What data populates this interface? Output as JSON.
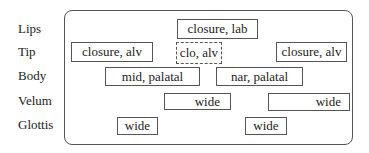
{
  "tiers": [
    {
      "label": "Lips"
    },
    {
      "label": "Tip"
    },
    {
      "label": "Body"
    },
    {
      "label": "Velum"
    },
    {
      "label": "Glottis"
    }
  ],
  "gestures": [
    {
      "tier": "Lips",
      "label": "closure, lab",
      "style": "solid"
    },
    {
      "tier": "Tip",
      "label": "closure, alv",
      "style": "solid"
    },
    {
      "tier": "Tip",
      "label": "clo, alv",
      "style": "dashed"
    },
    {
      "tier": "Tip",
      "label": "closure, alv",
      "style": "solid"
    },
    {
      "tier": "Body",
      "label": "mid, palatal",
      "style": "solid"
    },
    {
      "tier": "Body",
      "label": "nar, palatal",
      "style": "solid"
    },
    {
      "tier": "Velum",
      "label": "wide",
      "style": "solid"
    },
    {
      "tier": "Velum",
      "label": "wide",
      "style": "solid"
    },
    {
      "tier": "Glottis",
      "label": "wide",
      "style": "solid"
    },
    {
      "tier": "Glottis",
      "label": "wide",
      "style": "solid"
    }
  ]
}
